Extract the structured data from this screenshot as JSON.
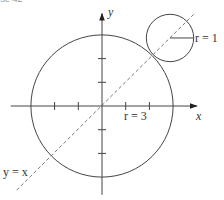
{
  "caption": "ercise 42",
  "colors": {
    "stroke": "#444444",
    "text": "#333333",
    "background": "#ffffff"
  },
  "geometry": {
    "origin_px": [
      102,
      106
    ],
    "unit_px": 23.7,
    "x_axis": {
      "from": -3.85,
      "to": 4.0
    },
    "y_axis": {
      "from": -3.75,
      "to": 3.9
    },
    "x_ticks": [
      -2,
      -1,
      1,
      2
    ],
    "y_ticks": [
      -2,
      -1,
      1,
      2
    ],
    "big_circle": {
      "center": [
        0,
        0
      ],
      "r": 3
    },
    "small_circle": {
      "center": [
        2.87,
        2.87
      ],
      "r": 1
    },
    "radius_segment": {
      "from": [
        2.87,
        2.87
      ],
      "to": [
        3.87,
        2.87
      ]
    },
    "dashed_line": {
      "from": [
        -3.6,
        -3.55
      ],
      "to": [
        3.95,
        3.95
      ]
    }
  },
  "labels": {
    "y_axis": "y",
    "x_axis": "x",
    "small_radius": "r = 1",
    "big_radius": "r = 3",
    "line": "y = x"
  }
}
